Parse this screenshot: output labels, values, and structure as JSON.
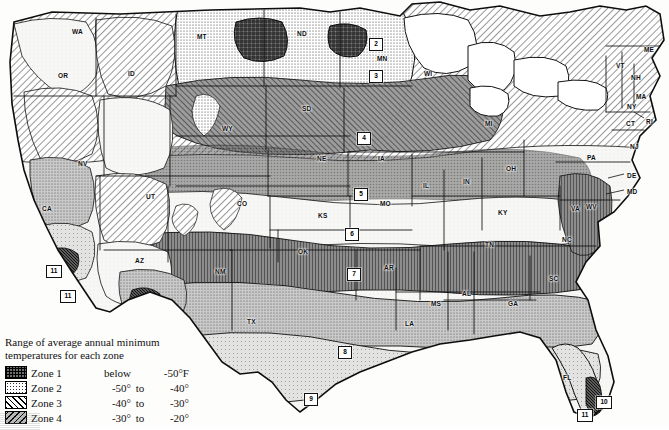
{
  "map": {
    "type": "choropleth-hardiness-zone-map",
    "region": "Continental United States",
    "states": [
      {
        "abbr": "WA",
        "x": 72,
        "y": 28
      },
      {
        "abbr": "OR",
        "x": 58,
        "y": 72
      },
      {
        "abbr": "ID",
        "x": 128,
        "y": 70
      },
      {
        "abbr": "MT",
        "x": 197,
        "y": 33
      },
      {
        "abbr": "ND",
        "x": 297,
        "y": 30
      },
      {
        "abbr": "MN",
        "x": 377,
        "y": 55
      },
      {
        "abbr": "WI",
        "x": 424,
        "y": 70
      },
      {
        "abbr": "SD",
        "x": 302,
        "y": 105
      },
      {
        "abbr": "WY",
        "x": 222,
        "y": 125
      },
      {
        "abbr": "NV",
        "x": 78,
        "y": 160
      },
      {
        "abbr": "UT",
        "x": 146,
        "y": 193
      },
      {
        "abbr": "CO",
        "x": 237,
        "y": 200
      },
      {
        "abbr": "NE",
        "x": 317,
        "y": 155
      },
      {
        "abbr": "IA",
        "x": 378,
        "y": 155
      },
      {
        "abbr": "IL",
        "x": 423,
        "y": 182
      },
      {
        "abbr": "IN",
        "x": 463,
        "y": 178
      },
      {
        "abbr": "OH",
        "x": 506,
        "y": 165
      },
      {
        "abbr": "MI",
        "x": 485,
        "y": 120
      },
      {
        "abbr": "MO",
        "x": 380,
        "y": 200
      },
      {
        "abbr": "KS",
        "x": 318,
        "y": 212
      },
      {
        "abbr": "OK",
        "x": 298,
        "y": 248
      },
      {
        "abbr": "AR",
        "x": 384,
        "y": 264
      },
      {
        "abbr": "TX",
        "x": 247,
        "y": 318
      },
      {
        "abbr": "LA",
        "x": 405,
        "y": 320
      },
      {
        "abbr": "MS",
        "x": 431,
        "y": 300
      },
      {
        "abbr": "AL",
        "x": 462,
        "y": 290
      },
      {
        "abbr": "GA",
        "x": 508,
        "y": 300
      },
      {
        "abbr": "FL",
        "x": 563,
        "y": 374
      },
      {
        "abbr": "SC",
        "x": 549,
        "y": 275
      },
      {
        "abbr": "NC",
        "x": 562,
        "y": 236
      },
      {
        "abbr": "TN",
        "x": 485,
        "y": 241
      },
      {
        "abbr": "KY",
        "x": 498,
        "y": 209
      },
      {
        "abbr": "VA",
        "x": 571,
        "y": 205
      },
      {
        "abbr": "WV",
        "x": 586,
        "y": 203
      },
      {
        "abbr": "PA",
        "x": 587,
        "y": 154
      },
      {
        "abbr": "NY",
        "x": 627,
        "y": 103
      },
      {
        "abbr": "VT",
        "x": 616,
        "y": 62
      },
      {
        "abbr": "NH",
        "x": 631,
        "y": 74
      },
      {
        "abbr": "ME",
        "x": 644,
        "y": 46
      },
      {
        "abbr": "MA",
        "x": 636,
        "y": 93
      },
      {
        "abbr": "RI",
        "x": 646,
        "y": 118
      },
      {
        "abbr": "CT",
        "x": 626,
        "y": 120
      },
      {
        "abbr": "NJ",
        "x": 630,
        "y": 143
      },
      {
        "abbr": "DE",
        "x": 627,
        "y": 172
      },
      {
        "abbr": "MD",
        "x": 627,
        "y": 188
      },
      {
        "abbr": "AZ",
        "x": 135,
        "y": 257
      },
      {
        "abbr": "NM",
        "x": 215,
        "y": 268
      },
      {
        "abbr": "CA",
        "x": 42,
        "y": 205
      }
    ],
    "zone_markers": [
      {
        "label": "2",
        "x": 369,
        "y": 38
      },
      {
        "label": "3",
        "x": 369,
        "y": 70
      },
      {
        "label": "4",
        "x": 357,
        "y": 132
      },
      {
        "label": "5",
        "x": 354,
        "y": 188
      },
      {
        "label": "6",
        "x": 345,
        "y": 228
      },
      {
        "label": "7",
        "x": 347,
        "y": 268
      },
      {
        "label": "8",
        "x": 338,
        "y": 346
      },
      {
        "label": "9",
        "x": 304,
        "y": 393
      },
      {
        "label": "10",
        "x": 596,
        "y": 396
      },
      {
        "label": "11",
        "x": 577,
        "y": 409
      },
      {
        "label": "11",
        "x": 46,
        "y": 265
      },
      {
        "label": "11",
        "x": 60,
        "y": 290
      }
    ]
  },
  "legend": {
    "title_line_1": "Range of average annual minimum",
    "title_line_2": "temperatures for each zone",
    "columns": [
      "swatch",
      "zone",
      "low",
      "connector",
      "high"
    ],
    "rows": [
      {
        "zone": "Zone 1",
        "pattern": "crosshatch-grid",
        "low": "below",
        "connector": "",
        "high": "-50°F"
      },
      {
        "zone": "Zone 2",
        "pattern": "stipple-dots",
        "low": "-50°",
        "connector": "to",
        "high": "-40°"
      },
      {
        "zone": "Zone 3",
        "pattern": "diagonal-hatch",
        "low": "-40°",
        "connector": "to",
        "high": "-30°"
      },
      {
        "zone": "Zone 4",
        "pattern": "dense-diagonal-hatch",
        "low": "-30°",
        "connector": "to",
        "high": "-20°"
      }
    ]
  },
  "chart_data": {
    "type": "map",
    "categories": [
      "Zone 1",
      "Zone 2",
      "Zone 3",
      "Zone 4",
      "Zone 5",
      "Zone 6",
      "Zone 7",
      "Zone 8",
      "Zone 9",
      "Zone 10",
      "Zone 11"
    ],
    "values": [
      -55,
      -45,
      -35,
      -25,
      -15,
      -5,
      5,
      15,
      25,
      35,
      45
    ],
    "unit": "degrees Fahrenheit",
    "ylabel": "Average annual minimum temperature (°F)",
    "legend_position": "bottom-left",
    "grid": false
  }
}
